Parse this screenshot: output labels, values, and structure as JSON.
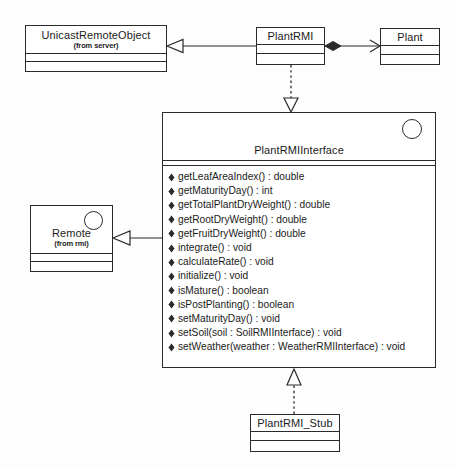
{
  "diagram": {
    "background_color": "#fdfdfd",
    "line_color": "#2a2a2a",
    "text_color": "#1b1b1b"
  },
  "classes": {
    "unicast_remote_object": {
      "name": "UnicastRemoteObject",
      "stereotype": "(from server)"
    },
    "plant_rmi": {
      "name": "PlantRMI"
    },
    "plant": {
      "name": "Plant"
    },
    "remote": {
      "name": "Remote",
      "stereotype": "(from rmi)",
      "marker": "interface-circle-icon"
    },
    "plant_rmi_interface": {
      "name": "PlantRMIInterface",
      "marker": "interface-circle-icon",
      "operations": [
        "getLeafAreaIndex() : double",
        "getMaturityDay() : int",
        "getTotalPlantDryWeight() : double",
        "getRootDryWeight() : double",
        "getFruitDryWeight() : double",
        "integrate() : void",
        "calculateRate() : void",
        "initialize() : void",
        "isMature() : boolean",
        "isPostPlanting() : boolean",
        "setMaturityDay() : void",
        "setSoil(soil : SoilRMIInterface) : void",
        "setWeather(weather : WeatherRMIInterface) : void"
      ]
    },
    "plant_rmi_stub": {
      "name": "PlantRMI_Stub"
    }
  },
  "relationships": [
    {
      "id": "plantrmi-extends-unicastremoteobject",
      "kind": "generalization",
      "from": "PlantRMI",
      "to": "UnicastRemoteObject",
      "line": "solid",
      "head": "hollow-triangle-arrow-icon"
    },
    {
      "id": "plantrmi-composes-plant",
      "kind": "composition",
      "from": "PlantRMI",
      "to": "Plant",
      "line": "solid",
      "head": "open-arrow-icon",
      "tail": "filled-diamond-icon"
    },
    {
      "id": "plantrmi-realizes-plantrmiinterface",
      "kind": "realization",
      "from": "PlantRMI",
      "to": "PlantRMIInterface",
      "line": "dashed",
      "head": "hollow-triangle-arrow-icon"
    },
    {
      "id": "plantrmiinterface-extends-remote",
      "kind": "generalization",
      "from": "PlantRMIInterface",
      "to": "Remote",
      "line": "solid",
      "head": "hollow-triangle-arrow-icon"
    },
    {
      "id": "plantrmistub-realizes-plantrmiinterface",
      "kind": "realization",
      "from": "PlantRMI_Stub",
      "to": "PlantRMIInterface",
      "line": "dashed",
      "head": "hollow-triangle-arrow-icon"
    }
  ]
}
